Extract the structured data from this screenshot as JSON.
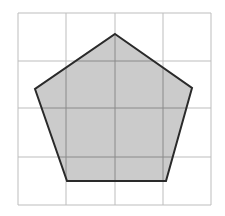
{
  "diagram": {
    "type": "pentagon-on-grid",
    "grid": {
      "columns": 4,
      "rows": 4,
      "x_lines": [
        18,
        66,
        115,
        163,
        211
      ],
      "y_lines": [
        13,
        61,
        108,
        157,
        205
      ],
      "line_color": "#bdbdbd"
    },
    "shape": {
      "kind": "pentagon",
      "vertices": [
        [
          115,
          34
        ],
        [
          192,
          88
        ],
        [
          166,
          181
        ],
        [
          67,
          181
        ],
        [
          35,
          89
        ]
      ],
      "fill_color": "#cbcbcb",
      "stroke_color": "#2a2a2a",
      "stroke_width": 2,
      "inner_grid_color": "#8a8a8a"
    }
  }
}
